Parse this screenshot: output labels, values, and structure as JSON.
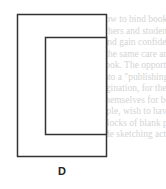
{
  "figure": {
    "label": "D",
    "stroke_color": "#333333",
    "outer_rect": {
      "x": 17,
      "y": 14,
      "width": 89,
      "height": 142
    },
    "inner_rect": {
      "x": 45,
      "y": 37,
      "width": 61,
      "height": 97
    }
  },
  "background_text": {
    "color": "#d4d4d4",
    "lines": [
      "ing how to bind books is a usef",
      "e teachers and students alike. S",
      "ride and gain confidence as they",
      "with the same care and atten",
      "red book. The opportunities fo",
      "om into a \"publishing house\" a",
      "r imagination, for there are b",
      "ugh themselves for bookbindin",
      "example, wish to have your s",
      "lish blocks of blank pages in",
      "include sketching activities. W"
    ]
  }
}
